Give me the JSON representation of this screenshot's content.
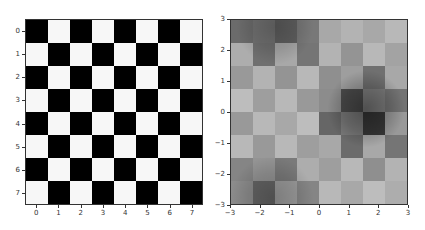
{
  "chart_data": [
    {
      "type": "heatmap",
      "title": "",
      "description": "8x8 binary checkerboard",
      "xlabel": "",
      "ylabel": "",
      "x_ticks": [
        0,
        1,
        2,
        3,
        4,
        5,
        6,
        7
      ],
      "y_ticks": [
        0,
        1,
        2,
        3,
        4,
        5,
        6,
        7
      ],
      "xlim": [
        -0.5,
        7.5
      ],
      "ylim": [
        7.5,
        -0.5
      ],
      "colormap": "gray",
      "values": [
        [
          0,
          1,
          0,
          1,
          0,
          1,
          0,
          1
        ],
        [
          1,
          0,
          1,
          0,
          1,
          0,
          1,
          0
        ],
        [
          0,
          1,
          0,
          1,
          0,
          1,
          0,
          1
        ],
        [
          1,
          0,
          1,
          0,
          1,
          0,
          1,
          0
        ],
        [
          0,
          1,
          0,
          1,
          0,
          1,
          0,
          1
        ],
        [
          1,
          0,
          1,
          0,
          1,
          0,
          1,
          0
        ],
        [
          0,
          1,
          0,
          1,
          0,
          1,
          0,
          1
        ],
        [
          1,
          0,
          1,
          0,
          1,
          0,
          1,
          0
        ]
      ]
    },
    {
      "type": "heatmap",
      "title": "",
      "description": "Checkerboard blended with a smooth function (alpha overlay, grayscale)",
      "xlabel": "",
      "ylabel": "",
      "x_ticks": [
        -3,
        -2,
        -1,
        0,
        1,
        2,
        3
      ],
      "y_ticks": [
        3,
        2,
        1,
        0,
        -1,
        -2,
        -3
      ],
      "xlim": [
        -3,
        3
      ],
      "ylim": [
        -3,
        3
      ],
      "colormap": "gray",
      "checker_gray": [
        [
          0.42,
          0.45,
          0.38,
          0.47,
          0.66,
          0.7,
          0.66,
          0.72
        ],
        [
          0.68,
          0.44,
          0.66,
          0.46,
          0.7,
          0.58,
          0.72,
          0.64
        ],
        [
          0.6,
          0.7,
          0.58,
          0.72,
          0.56,
          0.62,
          0.44,
          0.66
        ],
        [
          0.74,
          0.62,
          0.72,
          0.6,
          0.55,
          0.3,
          0.5,
          0.45
        ],
        [
          0.6,
          0.72,
          0.66,
          0.74,
          0.4,
          0.48,
          0.22,
          0.6
        ],
        [
          0.72,
          0.6,
          0.72,
          0.62,
          0.66,
          0.42,
          0.66,
          0.46
        ],
        [
          0.52,
          0.58,
          0.48,
          0.68,
          0.62,
          0.72,
          0.56,
          0.7
        ],
        [
          0.55,
          0.4,
          0.62,
          0.52,
          0.72,
          0.66,
          0.74,
          0.68
        ]
      ],
      "dark_regions": [
        {
          "cx": 1.6,
          "cy": 0.1,
          "r": 1.3,
          "intensity": 0.75
        },
        {
          "cx": -1.5,
          "cy": 2.8,
          "r": 1.3,
          "intensity": 0.45
        },
        {
          "cx": -1.6,
          "cy": -2.8,
          "r": 1.4,
          "intensity": 0.45
        }
      ]
    }
  ]
}
